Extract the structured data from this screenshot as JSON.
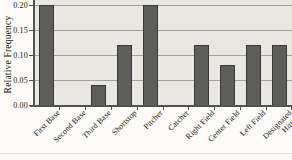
{
  "chart_data": {
    "type": "bar",
    "title": "",
    "xlabel": "",
    "ylabel": "Relative Frequency",
    "categories": [
      "First Base",
      "Second Base",
      "Third Base",
      "Shortstop",
      "Pitcher",
      "Catcher",
      "Right Field",
      "Center Field",
      "Left Field",
      "Designated Hitter"
    ],
    "values": [
      0.2,
      0.0,
      0.04,
      0.12,
      0.2,
      0.0,
      0.12,
      0.08,
      0.12,
      0.12
    ],
    "xtick_labels": [
      "First Base",
      "Second Base",
      "Third Base",
      "Shortstop",
      "Pitcher",
      "Catcher",
      "Right Field",
      "Center Field",
      "Left Field",
      "Designated\nHitter"
    ],
    "ytick_labels": [
      "0.20",
      "0.15",
      "0.10",
      "0.05",
      "0.00"
    ],
    "yticks": [
      0.2,
      0.15,
      0.1,
      0.05,
      0.0
    ],
    "ylim": [
      0,
      0.2
    ],
    "grid": true,
    "legend": "none",
    "colors": {
      "page_bg": "#fcfbf7",
      "plot_bg": "#e8e7e2",
      "bar_fill": "#5d5d5b",
      "bar_border": "#383836",
      "gridline": "#a2a19d",
      "axis": "#52524f",
      "text": "#181815",
      "faint_rule": "#dddcd6"
    }
  }
}
